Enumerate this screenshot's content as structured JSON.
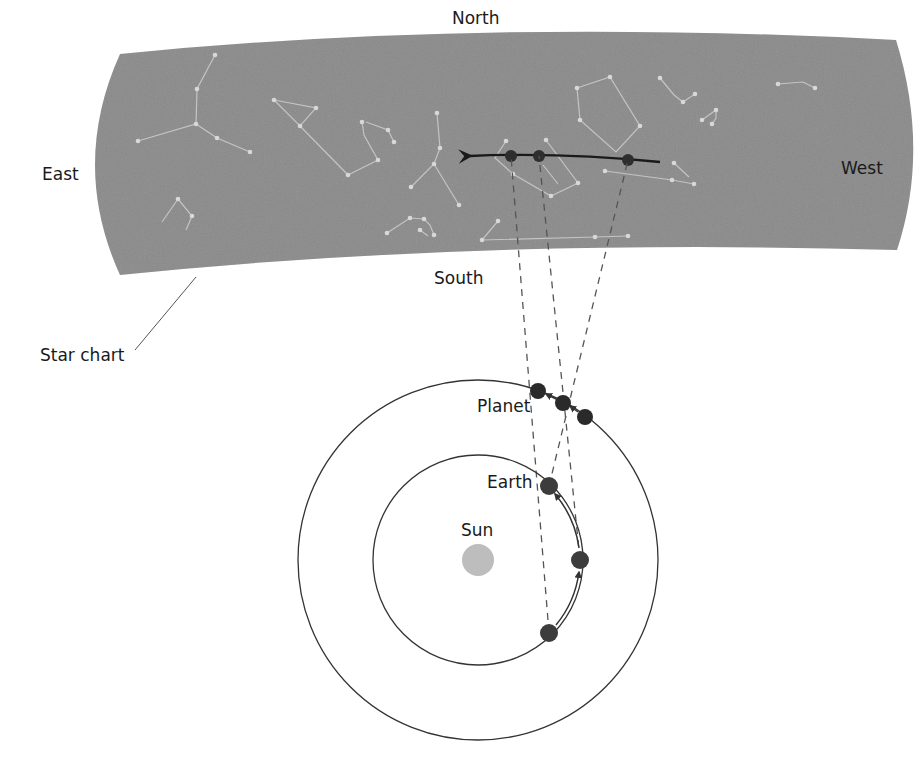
{
  "labels": {
    "north": "North",
    "south": "South",
    "east": "East",
    "west": "West",
    "star_chart": "Star chart",
    "planet": "Planet",
    "earth": "Earth",
    "sun": "Sun"
  },
  "colors": {
    "sky": "#8a8a8a",
    "star": "#d8d8d8",
    "constellation_line": "#c4c4c4",
    "body": "#2e2e2e",
    "earth": "#3c3c3c",
    "sun": "#bdbdbd",
    "orbit": "#333333",
    "sightline": "#555555"
  },
  "diagram": {
    "sun": {
      "cx": 478,
      "cy": 560,
      "r": 16
    },
    "earth_orbit": {
      "cx": 478,
      "cy": 560,
      "r": 105
    },
    "planet_orbit": {
      "cx": 478,
      "cy": 560,
      "r": 180
    },
    "earth_positions": [
      [
        549,
        633
      ],
      [
        580,
        560
      ],
      [
        549,
        486
      ]
    ],
    "planet_positions": [
      [
        538,
        391
      ],
      [
        563,
        403
      ],
      [
        585,
        417
      ]
    ],
    "sky_positions": [
      [
        511,
        156
      ],
      [
        539,
        156
      ],
      [
        628,
        160
      ]
    ]
  }
}
